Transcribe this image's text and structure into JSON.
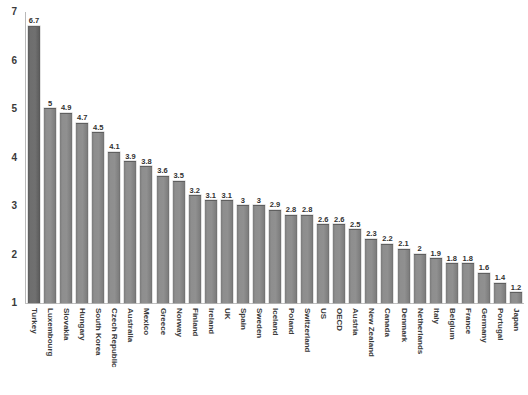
{
  "chart_data": {
    "type": "bar",
    "title": "",
    "subtitle": "",
    "xlabel": "",
    "ylabel": "",
    "ylim": [
      1,
      7
    ],
    "yticks": [
      1,
      2,
      3,
      4,
      5,
      6,
      7
    ],
    "ytick_labels": [
      "1",
      "2",
      "3",
      "4",
      "5",
      "6",
      "7"
    ],
    "grid": false,
    "legend": false,
    "legend_position": "none",
    "bar_color": "#8a8a8a",
    "highlight_color": "#6b6b6b",
    "background_color": "#ffffff",
    "axis_color": "#bdbdbd",
    "categories": [
      "Turkey",
      "Luxembourg",
      "Slovakia",
      "Hungary",
      "South Korea",
      "Czech Republic",
      "Australia",
      "Mexico",
      "Greece",
      "Norway",
      "Finland",
      "Ireland",
      "UK",
      "Spain",
      "Sweden",
      "Iceland",
      "Poland",
      "Switzerland",
      "US",
      "OECD",
      "Austria",
      "New Zealand",
      "Canada",
      "Denmark",
      "Netherlands",
      "Italy",
      "Belgium",
      "France",
      "Germany",
      "Portugal",
      "Japan"
    ],
    "values": [
      6.7,
      5,
      4.9,
      4.7,
      4.5,
      4.1,
      3.9,
      3.8,
      3.6,
      3.5,
      3.2,
      3.1,
      3.1,
      3,
      3,
      2.9,
      2.8,
      2.8,
      2.6,
      2.6,
      2.5,
      2.3,
      2.2,
      2.1,
      2,
      1.9,
      1.8,
      1.8,
      1.6,
      1.4,
      1.2
    ],
    "value_labels": [
      "6.7",
      "5",
      "4.9",
      "4.7",
      "4.5",
      "4.1",
      "3.9",
      "3.8",
      "3.6",
      "3.5",
      "3.2",
      "3.1",
      "3.1",
      "3",
      "3",
      "2.9",
      "2.8",
      "2.8",
      "2.6",
      "2.6",
      "2.5",
      "2.3",
      "2.2",
      "2.1",
      "2",
      "1.9",
      "1.8",
      "1.8",
      "1.6",
      "1.4",
      "1.2"
    ]
  }
}
